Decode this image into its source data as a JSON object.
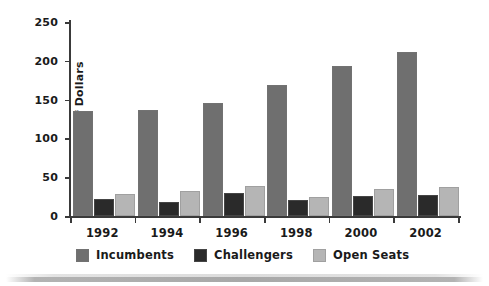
{
  "chart_data": {
    "type": "bar",
    "title": "",
    "subtitle": "",
    "xlabel": "",
    "ylabel": "Millions of Dollars",
    "categories": [
      "1992",
      "1994",
      "1996",
      "1998",
      "2000",
      "2002"
    ],
    "series": [
      {
        "name": "Incumbents",
        "color": "#6f6f6f",
        "values": [
          135,
          137,
          146,
          169,
          193,
          212
        ]
      },
      {
        "name": "Challengers",
        "color": "#2a2a2a",
        "values": [
          22,
          18,
          30,
          20,
          26,
          27
        ]
      },
      {
        "name": "Open Seats",
        "color": "#b5b5b5",
        "values": [
          29,
          32,
          39,
          25,
          35,
          38
        ]
      }
    ],
    "ylim": [
      0,
      250
    ],
    "yticks": [
      0,
      50,
      100,
      150,
      200,
      250
    ],
    "ytick_labels": [
      "0",
      "50",
      "100",
      "150",
      "200",
      "250"
    ],
    "grid": false,
    "legend_position": "bottom-left",
    "legend_entries": [
      "Incumbents",
      "Challengers",
      "Open Seats"
    ],
    "annotations": []
  },
  "figure": {
    "background_color": "#ffffff",
    "axis_color": "#3a3a3a",
    "text_color": "#1a1a1a"
  }
}
